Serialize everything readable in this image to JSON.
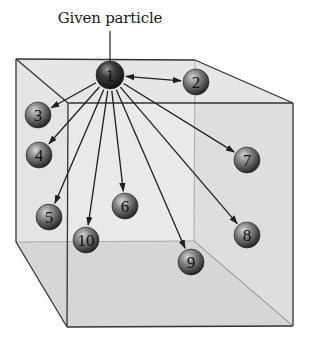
{
  "title": "Given particle",
  "colors": {
    "background": "#ffffff",
    "cube_face_light": "#e9e9e9",
    "cube_face_mid": "#dcdcdc",
    "cube_edge": "#333333",
    "arrow": "#1f1f1f",
    "sphere_dark": "#1c1c1c",
    "sphere_light": "#c9c9c9"
  },
  "cube": {
    "back": {
      "tl": [
        16,
        59
      ],
      "tr": [
        195,
        60
      ],
      "br": [
        194,
        241
      ],
      "bl": [
        16,
        242
      ]
    },
    "front": {
      "tl": [
        68,
        103
      ],
      "tr": [
        293,
        103
      ],
      "br": [
        293,
        326
      ],
      "bl": [
        67,
        327
      ]
    }
  },
  "particles": [
    {
      "id": "1",
      "label": "1",
      "x": 110,
      "y": 75,
      "r": 14,
      "role": "given"
    },
    {
      "id": "2",
      "label": "2",
      "x": 196,
      "y": 82,
      "r": 13
    },
    {
      "id": "3",
      "label": "3",
      "x": 38,
      "y": 115,
      "r": 13
    },
    {
      "id": "4",
      "label": "4",
      "x": 39,
      "y": 155,
      "r": 13
    },
    {
      "id": "5",
      "label": "5",
      "x": 49,
      "y": 217,
      "r": 13
    },
    {
      "id": "6",
      "label": "6",
      "x": 125,
      "y": 206,
      "r": 13
    },
    {
      "id": "7",
      "label": "7",
      "x": 247,
      "y": 160,
      "r": 13
    },
    {
      "id": "8",
      "label": "8",
      "x": 247,
      "y": 235,
      "r": 13
    },
    {
      "id": "9",
      "label": "9",
      "x": 191,
      "y": 262,
      "r": 13
    },
    {
      "id": "10",
      "label": "10",
      "x": 86,
      "y": 240,
      "r": 13
    }
  ],
  "arrows_from": "1",
  "double_headed_to": [
    "2"
  ]
}
